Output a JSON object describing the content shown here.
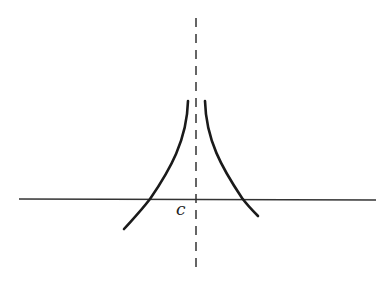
{
  "diagram": {
    "asymptote_label": "c",
    "colors": {
      "curve": "#1a1a1a",
      "axis": "#333333",
      "asymptote": "#333333",
      "background": "#ffffff"
    }
  }
}
